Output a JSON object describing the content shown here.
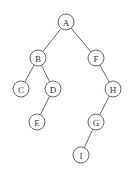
{
  "diagram": {
    "type": "binary-tree",
    "nodes": [
      {
        "id": "A",
        "label": "A",
        "x": 66,
        "y": 22
      },
      {
        "id": "B",
        "label": "B",
        "x": 38,
        "y": 58
      },
      {
        "id": "F",
        "label": "F",
        "x": 96,
        "y": 58
      },
      {
        "id": "C",
        "label": "C",
        "x": 21,
        "y": 89
      },
      {
        "id": "D",
        "label": "D",
        "x": 53,
        "y": 89
      },
      {
        "id": "H",
        "label": "H",
        "x": 113,
        "y": 89
      },
      {
        "id": "E",
        "label": "E",
        "x": 37,
        "y": 122
      },
      {
        "id": "G",
        "label": "G",
        "x": 96,
        "y": 122
      },
      {
        "id": "I",
        "label": "I",
        "x": 81,
        "y": 155
      }
    ],
    "edges": [
      {
        "from": "A",
        "to": "B"
      },
      {
        "from": "A",
        "to": "F"
      },
      {
        "from": "B",
        "to": "C"
      },
      {
        "from": "B",
        "to": "D"
      },
      {
        "from": "D",
        "to": "E"
      },
      {
        "from": "F",
        "to": "H"
      },
      {
        "from": "H",
        "to": "G"
      },
      {
        "from": "G",
        "to": "I"
      }
    ],
    "node_radius": 8
  }
}
